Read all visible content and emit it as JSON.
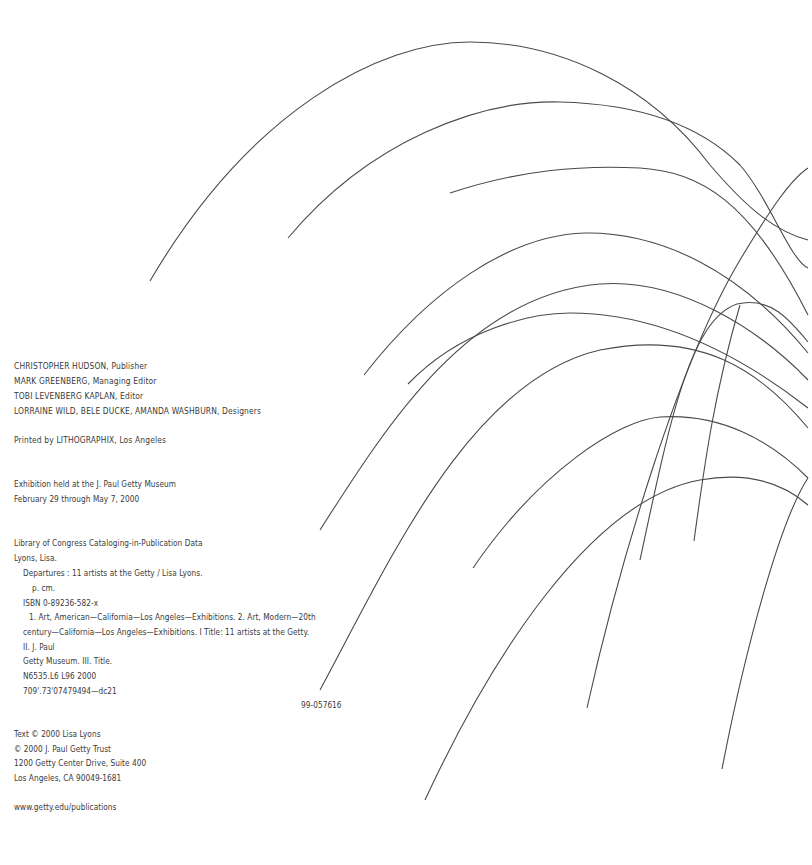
{
  "credits": {
    "publisher": {
      "name": "CHRISTOPHER HUDSON",
      "role": ", Publisher"
    },
    "managing_editor": {
      "name": "MARK GREENBERG",
      "role": ", Managing Editor"
    },
    "editor": {
      "name": "TOBI LEVENBERG KAPLAN",
      "role": ", Editor"
    },
    "designers": {
      "name": "LORRAINE WILD, BELE DUCKE, AMANDA WASHBURN",
      "role": ", Designers"
    },
    "printer": {
      "prefix": "Printed by ",
      "name": "LITHOGRAPHIX",
      "suffix": ", Los Angeles"
    }
  },
  "exhibition": {
    "line1": "Exhibition held at the J. Paul Getty Museum",
    "line2": "February 29 through May 7, 2000"
  },
  "cip": {
    "heading": "Library of Congress Cataloging-in-Publication Data",
    "author": "Lyons, Lisa.",
    "title": "Departures : 11 artists at the Getty / Lisa Lyons.",
    "pages": "p.  cm.",
    "isbn": "ISBN 0-89236-582-x",
    "subjects_1": "1. Art, American—California—Los Angeles—Exhibitions. 2. Art, Modern—20th",
    "subjects_2": "century—California—Los Angeles—Exhibitions. I Title: 11 artists at the Getty.",
    "added_1": "II. J. Paul",
    "added_2": "Getty Museum. III. Title.",
    "call_number": "N6535.L6 L96 2000",
    "dewey": "709'.73'07479494—dc21",
    "lccn": "99-057616"
  },
  "copyright": {
    "text": "Text © 2000 Lisa Lyons",
    "trust": "© 2000 J. Paul Getty Trust",
    "address_1": "1200 Getty Center Drive, Suite 400",
    "address_2": "Los Angeles, CA 90049-1681"
  },
  "web": {
    "url": "www.getty.edu/publications"
  },
  "artwork": {
    "description": "decorative-arcing-lines",
    "stroke_color": "#4a4a4a",
    "background": "#ffffff"
  }
}
